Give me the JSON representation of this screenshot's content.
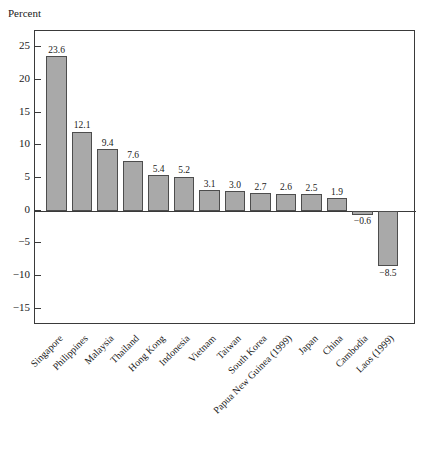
{
  "chart_data": {
    "type": "bar",
    "title": "",
    "subtitle": "",
    "xlabel": "",
    "ylabel": "Percent",
    "ylim": [
      -17.5,
      27.5
    ],
    "yticks": [
      25,
      20,
      15,
      10,
      5,
      0,
      -5,
      -10,
      -15
    ],
    "ytick_labels": [
      "25",
      "20",
      "15",
      "10",
      "5",
      "0",
      "−5",
      "−10",
      "−15"
    ],
    "grid": false,
    "legend": null,
    "bar_color": "#a9a9a9",
    "bar_edge_color": "#4d4d4d",
    "frame_color": "#3a3a3a",
    "categories": [
      "Singapore",
      "Philippines",
      "Malaysia",
      "Thailand",
      "Hong Kong",
      "Indonesia",
      "Vietnam",
      "Taiwan",
      "South Korea",
      "Papua New Guinea (1999)",
      "Japan",
      "China",
      "Cambodia",
      "Laos (1999)"
    ],
    "values": [
      23.6,
      12.1,
      9.4,
      7.6,
      5.4,
      5.2,
      3.1,
      3.0,
      2.7,
      2.6,
      2.5,
      1.9,
      -0.6,
      -8.5
    ],
    "value_labels": [
      "23.6",
      "12.1",
      "9.4",
      "7.6",
      "5.4",
      "5.2",
      "3.1",
      "3.0",
      "2.7",
      "2.6",
      "2.5",
      "1.9",
      "−0.6",
      "−8.5"
    ]
  },
  "axis": {
    "y_title": "Percent"
  }
}
